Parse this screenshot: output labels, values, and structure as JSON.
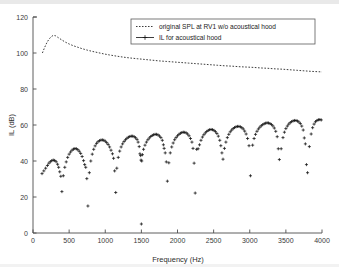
{
  "chart_data": {
    "type": "scatter",
    "title": "",
    "xlabel": "Frequency (Hz)",
    "ylabel": "IL (dB)",
    "xlim": [
      0,
      4000
    ],
    "ylim": [
      0,
      120
    ],
    "xticks": [
      0,
      500,
      1000,
      1500,
      2000,
      2500,
      3000,
      3500,
      4000
    ],
    "yticks": [
      0,
      20,
      40,
      60,
      80,
      100,
      120
    ],
    "xticklabels": [
      "0",
      "500",
      "1000",
      "1500",
      "2000",
      "2500",
      "3000",
      "3500",
      "4000"
    ],
    "yticklabels": [
      "0",
      "20",
      "40",
      "60",
      "80",
      "100",
      "120"
    ],
    "grid": false,
    "legend_position": "top-right",
    "legend": [
      {
        "label": "original SPL at RV1 w/o acoustical hood",
        "style": "dotted-line",
        "marker": "none"
      },
      {
        "label": "IL for acoustical hood",
        "style": "line",
        "marker": "plus"
      }
    ],
    "series": [
      {
        "name": "original SPL at RV1 w/o acoustical hood",
        "style": "dotted-line",
        "points": [
          [
            130,
            100.0
          ],
          [
            160,
            103.0
          ],
          [
            190,
            105.6
          ],
          [
            220,
            107.6
          ],
          [
            250,
            109.0
          ],
          [
            280,
            109.8
          ],
          [
            310,
            109.6
          ],
          [
            340,
            108.8
          ],
          [
            370,
            108.0
          ],
          [
            400,
            107.2
          ],
          [
            450,
            106.0
          ],
          [
            500,
            105.0
          ],
          [
            560,
            104.0
          ],
          [
            620,
            103.2
          ],
          [
            680,
            102.4
          ],
          [
            750,
            101.6
          ],
          [
            820,
            100.9
          ],
          [
            900,
            100.2
          ],
          [
            980,
            99.5
          ],
          [
            1060,
            98.9
          ],
          [
            1150,
            98.3
          ],
          [
            1250,
            97.7
          ],
          [
            1350,
            97.2
          ],
          [
            1450,
            96.8
          ],
          [
            1550,
            96.4
          ],
          [
            1650,
            96.0
          ],
          [
            1750,
            95.6
          ],
          [
            1850,
            95.3
          ],
          [
            1950,
            95.0
          ],
          [
            2050,
            94.7
          ],
          [
            2150,
            94.4
          ],
          [
            2250,
            94.1
          ],
          [
            2350,
            93.8
          ],
          [
            2450,
            93.5
          ],
          [
            2550,
            93.2
          ],
          [
            2650,
            92.9
          ],
          [
            2750,
            92.7
          ],
          [
            2850,
            92.4
          ],
          [
            2950,
            92.2
          ],
          [
            3050,
            92.0
          ],
          [
            3150,
            91.7
          ],
          [
            3250,
            91.5
          ],
          [
            3350,
            91.2
          ],
          [
            3450,
            91.0
          ],
          [
            3550,
            90.7
          ],
          [
            3650,
            90.4
          ],
          [
            3750,
            90.1
          ],
          [
            3850,
            89.8
          ],
          [
            3950,
            89.6
          ],
          [
            4000,
            89.5
          ]
        ]
      },
      {
        "name": "IL for acoustical hood",
        "style": "plus-markers",
        "points": [
          [
            125,
            33.0
          ],
          [
            150,
            34.5
          ],
          [
            175,
            36.0
          ],
          [
            200,
            37.5
          ],
          [
            220,
            38.8
          ],
          [
            240,
            39.6
          ],
          [
            260,
            40.2
          ],
          [
            280,
            40.5
          ],
          [
            300,
            40.3
          ],
          [
            320,
            39.6
          ],
          [
            340,
            38.2
          ],
          [
            355,
            36.5
          ],
          [
            370,
            34.0
          ],
          [
            385,
            31.5
          ],
          [
            400,
            23.0
          ],
          [
            420,
            31.8
          ],
          [
            440,
            36.5
          ],
          [
            460,
            39.5
          ],
          [
            480,
            42.0
          ],
          [
            500,
            43.8
          ],
          [
            520,
            45.0
          ],
          [
            540,
            46.0
          ],
          [
            560,
            46.6
          ],
          [
            580,
            46.9
          ],
          [
            600,
            46.8
          ],
          [
            620,
            46.3
          ],
          [
            640,
            45.4
          ],
          [
            660,
            44.2
          ],
          [
            680,
            42.5
          ],
          [
            700,
            40.2
          ],
          [
            715,
            38.0
          ],
          [
            730,
            36.5
          ],
          [
            745,
            30.2
          ],
          [
            760,
            15.0
          ],
          [
            780,
            33.5
          ],
          [
            800,
            40.0
          ],
          [
            820,
            43.8
          ],
          [
            840,
            46.5
          ],
          [
            860,
            48.4
          ],
          [
            880,
            49.8
          ],
          [
            900,
            50.7
          ],
          [
            920,
            51.3
          ],
          [
            940,
            51.6
          ],
          [
            960,
            51.7
          ],
          [
            980,
            51.5
          ],
          [
            1000,
            51.0
          ],
          [
            1020,
            50.2
          ],
          [
            1040,
            49.2
          ],
          [
            1060,
            47.8
          ],
          [
            1080,
            46.0
          ],
          [
            1100,
            44.0
          ],
          [
            1115,
            41.5
          ],
          [
            1130,
            34.5
          ],
          [
            1145,
            22.5
          ],
          [
            1160,
            36.0
          ],
          [
            1180,
            42.0
          ],
          [
            1200,
            45.5
          ],
          [
            1220,
            47.8
          ],
          [
            1240,
            49.5
          ],
          [
            1260,
            50.8
          ],
          [
            1280,
            51.8
          ],
          [
            1300,
            52.6
          ],
          [
            1320,
            53.2
          ],
          [
            1340,
            53.6
          ],
          [
            1360,
            53.8
          ],
          [
            1380,
            53.8
          ],
          [
            1400,
            53.5
          ],
          [
            1420,
            52.9
          ],
          [
            1440,
            52.0
          ],
          [
            1455,
            50.5
          ],
          [
            1470,
            48.0
          ],
          [
            1480,
            44.0
          ],
          [
            1490,
            43.0
          ],
          [
            1495,
            40.5
          ],
          [
            1500,
            5.0
          ],
          [
            1505,
            40.0
          ],
          [
            1515,
            43.5
          ],
          [
            1530,
            46.5
          ],
          [
            1550,
            48.8
          ],
          [
            1570,
            50.5
          ],
          [
            1590,
            51.8
          ],
          [
            1610,
            52.8
          ],
          [
            1630,
            53.6
          ],
          [
            1650,
            54.2
          ],
          [
            1670,
            54.6
          ],
          [
            1690,
            54.8
          ],
          [
            1710,
            54.8
          ],
          [
            1730,
            54.5
          ],
          [
            1750,
            53.9
          ],
          [
            1770,
            53.0
          ],
          [
            1790,
            51.5
          ],
          [
            1805,
            49.0
          ],
          [
            1815,
            47.0
          ],
          [
            1830,
            44.5
          ],
          [
            1845,
            39.5
          ],
          [
            1860,
            28.8
          ],
          [
            1880,
            39.0
          ],
          [
            1900,
            44.5
          ],
          [
            1920,
            47.8
          ],
          [
            1940,
            50.0
          ],
          [
            1960,
            51.8
          ],
          [
            1980,
            53.0
          ],
          [
            2000,
            54.0
          ],
          [
            2020,
            54.8
          ],
          [
            2040,
            55.4
          ],
          [
            2060,
            55.8
          ],
          [
            2080,
            56.0
          ],
          [
            2100,
            55.9
          ],
          [
            2120,
            55.6
          ],
          [
            2140,
            55.0
          ],
          [
            2160,
            54.0
          ],
          [
            2180,
            52.5
          ],
          [
            2200,
            50.5
          ],
          [
            2215,
            47.0
          ],
          [
            2230,
            38.8
          ],
          [
            2245,
            22.2
          ],
          [
            2265,
            46.5
          ],
          [
            2285,
            46.8
          ],
          [
            2305,
            49.0
          ],
          [
            2325,
            51.5
          ],
          [
            2345,
            53.3
          ],
          [
            2365,
            54.6
          ],
          [
            2385,
            55.6
          ],
          [
            2405,
            56.4
          ],
          [
            2425,
            57.0
          ],
          [
            2445,
            57.4
          ],
          [
            2465,
            57.5
          ],
          [
            2485,
            57.4
          ],
          [
            2505,
            57.0
          ],
          [
            2525,
            56.3
          ],
          [
            2545,
            55.3
          ],
          [
            2565,
            53.8
          ],
          [
            2585,
            51.5
          ],
          [
            2600,
            48.5
          ],
          [
            2615,
            44.5
          ],
          [
            2630,
            41.0
          ],
          [
            2650,
            47.0
          ],
          [
            2670,
            50.5
          ],
          [
            2690,
            53.0
          ],
          [
            2710,
            54.8
          ],
          [
            2730,
            56.2
          ],
          [
            2750,
            57.2
          ],
          [
            2770,
            58.0
          ],
          [
            2790,
            58.6
          ],
          [
            2810,
            59.0
          ],
          [
            2830,
            59.2
          ],
          [
            2850,
            59.2
          ],
          [
            2870,
            59.0
          ],
          [
            2890,
            58.5
          ],
          [
            2910,
            57.8
          ],
          [
            2930,
            56.6
          ],
          [
            2950,
            55.0
          ],
          [
            2970,
            52.5
          ],
          [
            2990,
            48.5
          ],
          [
            3010,
            31.8
          ],
          [
            3040,
            48.8
          ],
          [
            3060,
            52.5
          ],
          [
            3080,
            54.8
          ],
          [
            3100,
            56.5
          ],
          [
            3120,
            57.8
          ],
          [
            3140,
            58.8
          ],
          [
            3160,
            59.6
          ],
          [
            3180,
            60.2
          ],
          [
            3200,
            60.7
          ],
          [
            3220,
            61.0
          ],
          [
            3240,
            61.2
          ],
          [
            3260,
            61.1
          ],
          [
            3280,
            60.8
          ],
          [
            3300,
            60.3
          ],
          [
            3320,
            59.5
          ],
          [
            3340,
            58.3
          ],
          [
            3360,
            56.5
          ],
          [
            3380,
            53.5
          ],
          [
            3395,
            46.8
          ],
          [
            3410,
            40.8
          ],
          [
            3435,
            46.8
          ],
          [
            3460,
            53.0
          ],
          [
            3480,
            56.0
          ],
          [
            3500,
            58.0
          ],
          [
            3520,
            59.4
          ],
          [
            3540,
            60.5
          ],
          [
            3560,
            61.3
          ],
          [
            3580,
            61.9
          ],
          [
            3600,
            62.3
          ],
          [
            3620,
            62.5
          ],
          [
            3640,
            62.5
          ],
          [
            3660,
            62.2
          ],
          [
            3680,
            61.7
          ],
          [
            3700,
            60.8
          ],
          [
            3720,
            59.4
          ],
          [
            3740,
            57.2
          ],
          [
            3755,
            52.8
          ],
          [
            3770,
            49.5
          ],
          [
            3785,
            38.0
          ],
          [
            3800,
            33.5
          ],
          [
            3825,
            48.0
          ],
          [
            3850,
            55.0
          ],
          [
            3870,
            58.5
          ],
          [
            3890,
            60.5
          ],
          [
            3910,
            61.8
          ],
          [
            3930,
            62.5
          ],
          [
            3950,
            62.9
          ],
          [
            3970,
            63.0
          ],
          [
            3990,
            62.8
          ]
        ]
      }
    ]
  },
  "axes": {
    "xlabel": "Frequency (Hz)",
    "ylabel": "IL (dB)"
  }
}
